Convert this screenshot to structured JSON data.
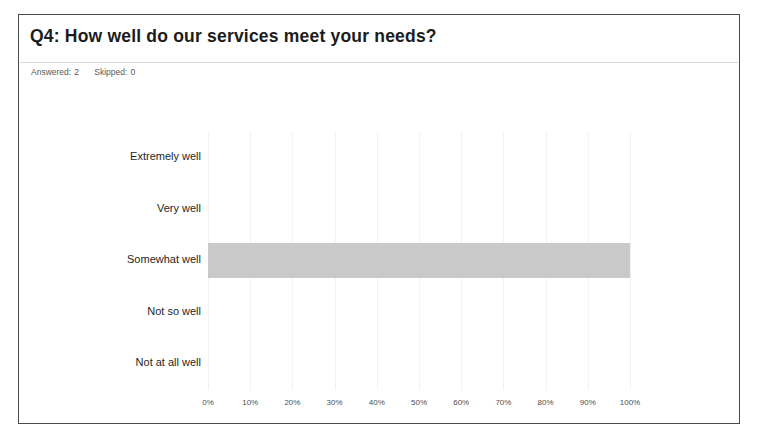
{
  "card": {
    "title": "Q4: How well do our services meet your needs?",
    "summary": {
      "answered_label": "Answered:",
      "answered_value": "2",
      "skipped_label": "Skipped:",
      "skipped_value": "0"
    }
  },
  "colors": {
    "bar_fill": "#c9c9c9",
    "card_border": "#4a4a4a",
    "divider": "#d8d8d8",
    "gridline": "#f2f2f2",
    "title_text": "#1c1c1c",
    "label_text": "#262626",
    "tick_text": "#4d4d4d"
  },
  "chart_data": {
    "type": "bar",
    "orientation": "horizontal",
    "title": "Q4: How well do our services meet your needs?",
    "categories": [
      "Extremely well",
      "Very well",
      "Somewhat well",
      "Not so well",
      "Not at all well"
    ],
    "values": [
      0,
      0,
      100,
      0,
      0
    ],
    "value_unit": "percent",
    "xlabel": "",
    "ylabel": "",
    "xlim": [
      0,
      100
    ],
    "tick_labels": [
      "0%",
      "10%",
      "20%",
      "30%",
      "40%",
      "50%",
      "60%",
      "70%",
      "80%",
      "90%",
      "100%"
    ],
    "tick_values": [
      0,
      10,
      20,
      30,
      40,
      50,
      60,
      70,
      80,
      90,
      100
    ],
    "grid": true,
    "grid_axis": "x",
    "legend": false,
    "answered": 2,
    "skipped": 0
  }
}
